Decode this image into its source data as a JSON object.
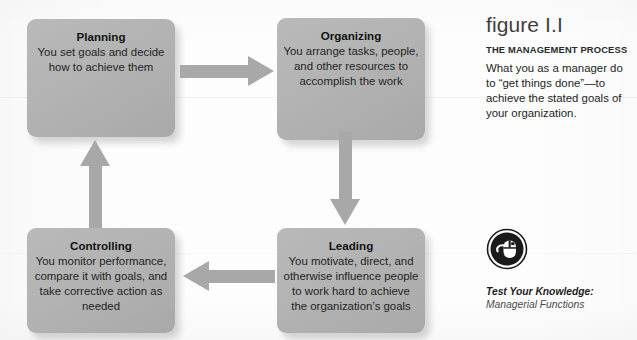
{
  "figure": {
    "label": "figure I.I",
    "subtitle": "THE MANAGEMENT PROCESS",
    "description": "What you as a manager do to “get things done”—to achieve the stated goals of your organization."
  },
  "process": {
    "boxes": [
      {
        "id": "planning",
        "title": "Planning",
        "body": "You set goals and decide how to achieve them"
      },
      {
        "id": "organizing",
        "title": "Organizing",
        "body": "You arrange tasks, people, and other resources to accomplish the work"
      },
      {
        "id": "leading",
        "title": "Leading",
        "body": "You motivate, direct, and otherwise influence people to work hard to achieve the organization’s goals"
      },
      {
        "id": "controlling",
        "title": "Controlling",
        "body": "You monitor performance, compare it with goals, and take corrective action as needed"
      }
    ],
    "arrows": [
      {
        "id": "planning-to-organizing",
        "direction": "right"
      },
      {
        "id": "organizing-to-leading",
        "direction": "down"
      },
      {
        "id": "leading-to-controlling",
        "direction": "left"
      },
      {
        "id": "controlling-to-planning",
        "direction": "up"
      }
    ]
  },
  "test_your_knowledge": {
    "icon": "computer-mouse-icon",
    "title": "Test Your Knowledge:",
    "subtitle": "Managerial Functions"
  },
  "colors": {
    "box_fill": "#b3b3b3",
    "arrow_fill": "#a8a8a8",
    "icon_fill": "#1a1a1a",
    "page_background": "#fdfdfd",
    "text": "#231f20"
  }
}
